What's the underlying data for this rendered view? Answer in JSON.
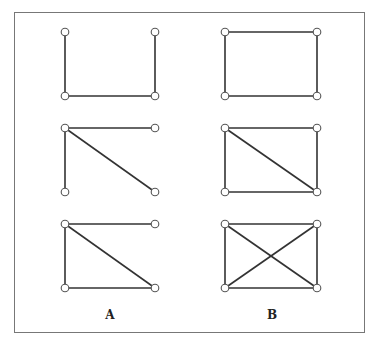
{
  "labels": {
    "a": "A",
    "b": "B"
  },
  "colors": {
    "edge": "#333333",
    "node_stroke": "#555555",
    "border": "#777777"
  },
  "graphs": [
    {
      "id": "A1",
      "nodes": [
        [
          65,
          32
        ],
        [
          155,
          32
        ],
        [
          65,
          96
        ],
        [
          155,
          96
        ]
      ],
      "edges": [
        [
          0,
          2
        ],
        [
          1,
          3
        ],
        [
          2,
          3
        ]
      ]
    },
    {
      "id": "B1",
      "nodes": [
        [
          225,
          32
        ],
        [
          317,
          32
        ],
        [
          225,
          96
        ],
        [
          317,
          96
        ]
      ],
      "edges": [
        [
          0,
          1
        ],
        [
          0,
          2
        ],
        [
          1,
          3
        ],
        [
          2,
          3
        ]
      ]
    },
    {
      "id": "A2",
      "nodes": [
        [
          65,
          128
        ],
        [
          155,
          128
        ],
        [
          65,
          192
        ],
        [
          155,
          192
        ]
      ],
      "edges": [
        [
          0,
          1
        ],
        [
          0,
          2
        ],
        [
          0,
          3
        ]
      ]
    },
    {
      "id": "B2",
      "nodes": [
        [
          225,
          128
        ],
        [
          317,
          128
        ],
        [
          225,
          192
        ],
        [
          317,
          192
        ]
      ],
      "edges": [
        [
          0,
          1
        ],
        [
          0,
          2
        ],
        [
          0,
          3
        ],
        [
          1,
          3
        ],
        [
          2,
          3
        ]
      ]
    },
    {
      "id": "A3",
      "nodes": [
        [
          65,
          224
        ],
        [
          155,
          224
        ],
        [
          65,
          288
        ],
        [
          155,
          288
        ]
      ],
      "edges": [
        [
          0,
          1
        ],
        [
          0,
          2
        ],
        [
          0,
          3
        ],
        [
          2,
          3
        ]
      ]
    },
    {
      "id": "B3",
      "nodes": [
        [
          225,
          224
        ],
        [
          317,
          224
        ],
        [
          225,
          288
        ],
        [
          317,
          288
        ]
      ],
      "edges": [
        [
          0,
          1
        ],
        [
          0,
          2
        ],
        [
          0,
          3
        ],
        [
          1,
          2
        ],
        [
          1,
          3
        ],
        [
          2,
          3
        ]
      ]
    }
  ]
}
